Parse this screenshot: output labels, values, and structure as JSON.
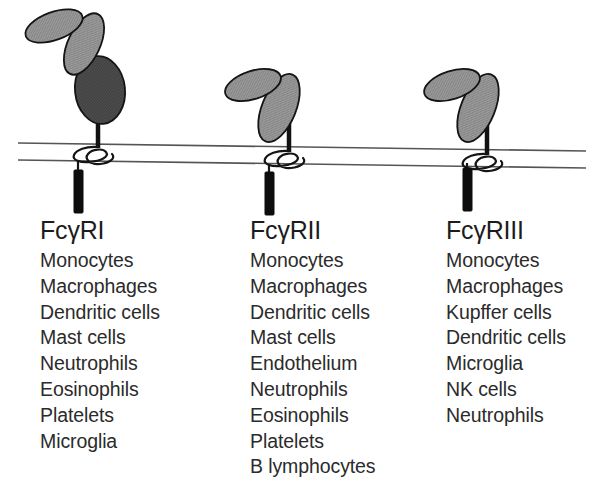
{
  "figure": {
    "background_color": "#ffffff",
    "ig_domain_light_color": "#8f8f8f",
    "ig_domain_dark_color": "#4a4a4a",
    "outline_color": "#1a1a1a",
    "membrane_line_color": "#555555",
    "itam_color": "#0d0d0d",
    "text_color": "#2b2b2b"
  },
  "receptors": [
    {
      "id": "fc-gamma-r1",
      "name_prefix": "Fc",
      "name_gamma": "γ",
      "name_suffix": "RI",
      "full_name": "FcγRI",
      "domain_count": 3,
      "domain_shades": [
        "light",
        "light",
        "dark"
      ],
      "cells": [
        "Monocytes",
        "Macrophages",
        "Dendritic cells",
        "Mast cells",
        "Neutrophils",
        "Eosinophils",
        "Platelets",
        "Microglia"
      ]
    },
    {
      "id": "fc-gamma-r2",
      "name_prefix": "Fc",
      "name_gamma": "γ",
      "name_suffix": "RII",
      "full_name": "FcγRII",
      "domain_count": 2,
      "domain_shades": [
        "light",
        "light"
      ],
      "cells": [
        "Monocytes",
        "Macrophages",
        "Dendritic cells",
        "Mast cells",
        "Endothelium",
        "Neutrophils",
        "Eosinophils",
        "Platelets",
        "B lymphocytes"
      ]
    },
    {
      "id": "fc-gamma-r3",
      "name_prefix": "Fc",
      "name_gamma": "γ",
      "name_suffix": "RIII",
      "full_name": "FcγRIII",
      "domain_count": 2,
      "domain_shades": [
        "light",
        "light"
      ],
      "cells": [
        "Monocytes",
        "Macrophages",
        "Kupffer cells",
        "Dendritic cells",
        "Microglia",
        "NK cells",
        "Neutrophils"
      ]
    }
  ]
}
